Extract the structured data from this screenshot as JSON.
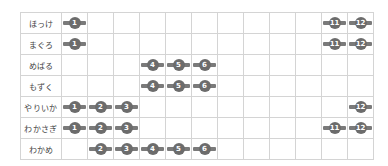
{
  "chart_data": {
    "type": "table",
    "title": "",
    "columns": [
      "1",
      "2",
      "3",
      "4",
      "5",
      "6",
      "7",
      "8",
      "9",
      "10",
      "11",
      "12"
    ],
    "rows": [
      {
        "label": "ほっけ",
        "months": [
          1,
          11,
          12
        ]
      },
      {
        "label": "まぐろ",
        "months": [
          1,
          11,
          12
        ]
      },
      {
        "label": "めばる",
        "months": [
          4,
          5,
          6
        ]
      },
      {
        "label": "もずく",
        "months": [
          4,
          5,
          6
        ]
      },
      {
        "label": "やりいか",
        "months": [
          1,
          2,
          3,
          12
        ]
      },
      {
        "label": "わかさぎ",
        "months": [
          1,
          2,
          3,
          11,
          12
        ]
      },
      {
        "label": "わかめ",
        "months": [
          2,
          3,
          4,
          5,
          6
        ]
      }
    ],
    "marker_style": {
      "bar_color": "#7a7a7a",
      "dot_color": "#6c6c6c",
      "text_color": "#ffffff"
    },
    "grid": true
  }
}
